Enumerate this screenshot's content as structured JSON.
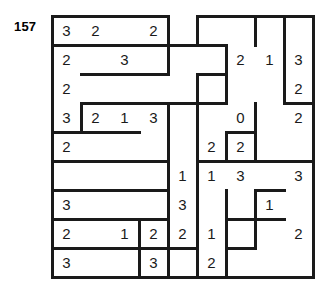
{
  "puzzle": {
    "label": "157",
    "grid": {
      "rows": 9,
      "cols": 9,
      "cell_size": 29,
      "origin_x": 52,
      "origin_y": 16
    },
    "line_color": "#1a1a1a",
    "digit_color": "#1a1a1a",
    "clues": [
      [
        {
          "c": 0,
          "v": "3"
        },
        {
          "c": 1,
          "v": "2"
        },
        {
          "c": 3,
          "v": "2"
        }
      ],
      [
        {
          "c": 0,
          "v": "2"
        },
        {
          "c": 2,
          "v": "3"
        },
        {
          "c": 6,
          "v": "2"
        },
        {
          "c": 7,
          "v": "1"
        },
        {
          "c": 8,
          "v": "3"
        }
      ],
      [
        {
          "c": 0,
          "v": "2"
        },
        {
          "c": 8,
          "v": "2"
        }
      ],
      [
        {
          "c": 0,
          "v": "3"
        },
        {
          "c": 1,
          "v": "2"
        },
        {
          "c": 2,
          "v": "1"
        },
        {
          "c": 3,
          "v": "3"
        },
        {
          "c": 6,
          "v": "0"
        },
        {
          "c": 8,
          "v": "2"
        }
      ],
      [
        {
          "c": 0,
          "v": "2"
        },
        {
          "c": 5,
          "v": "2"
        },
        {
          "c": 6,
          "v": "2"
        }
      ],
      [
        {
          "c": 4,
          "v": "1"
        },
        {
          "c": 5,
          "v": "1"
        },
        {
          "c": 6,
          "v": "3"
        },
        {
          "c": 8,
          "v": "3"
        }
      ],
      [
        {
          "c": 0,
          "v": "3"
        },
        {
          "c": 4,
          "v": "3"
        },
        {
          "c": 7,
          "v": "1"
        }
      ],
      [
        {
          "c": 0,
          "v": "2"
        },
        {
          "c": 2,
          "v": "1"
        },
        {
          "c": 3,
          "v": "2"
        },
        {
          "c": 4,
          "v": "2"
        },
        {
          "c": 5,
          "v": "1"
        },
        {
          "c": 8,
          "v": "2"
        }
      ],
      [
        {
          "c": 0,
          "v": "3"
        },
        {
          "c": 3,
          "v": "3"
        },
        {
          "c": 5,
          "v": "2"
        }
      ],
      [
        {
          "c": 0,
          "v": "1"
        },
        {
          "c": 1,
          "v": "2"
        },
        {
          "c": 4,
          "v": "2"
        },
        {
          "c": 6,
          "v": "2"
        },
        {
          "c": 8,
          "v": "2"
        }
      ]
    ],
    "walls_h": [
      {
        "r": 0,
        "c": 0
      },
      {
        "r": 0,
        "c": 1
      },
      {
        "r": 0,
        "c": 2
      },
      {
        "r": 0,
        "c": 3
      },
      {
        "r": 0,
        "c": 5
      },
      {
        "r": 0,
        "c": 6
      },
      {
        "r": 0,
        "c": 7
      },
      {
        "r": 0,
        "c": 8
      },
      {
        "r": 1,
        "c": 0
      },
      {
        "r": 1,
        "c": 1
      },
      {
        "r": 1,
        "c": 2
      },
      {
        "r": 1,
        "c": 3
      },
      {
        "r": 1,
        "c": 4
      },
      {
        "r": 1,
        "c": 5
      },
      {
        "r": 2,
        "c": 1
      },
      {
        "r": 2,
        "c": 2
      },
      {
        "r": 2,
        "c": 3
      },
      {
        "r": 2,
        "c": 5
      },
      {
        "r": 3,
        "c": 1
      },
      {
        "r": 3,
        "c": 2
      },
      {
        "r": 3,
        "c": 3
      },
      {
        "r": 3,
        "c": 4
      },
      {
        "r": 3,
        "c": 5
      },
      {
        "r": 3,
        "c": 8
      },
      {
        "r": 4,
        "c": 0
      },
      {
        "r": 4,
        "c": 1
      },
      {
        "r": 4,
        "c": 2
      },
      {
        "r": 4,
        "c": 6
      },
      {
        "r": 5,
        "c": 0
      },
      {
        "r": 5,
        "c": 1
      },
      {
        "r": 5,
        "c": 2
      },
      {
        "r": 5,
        "c": 3
      },
      {
        "r": 5,
        "c": 5
      },
      {
        "r": 5,
        "c": 6
      },
      {
        "r": 5,
        "c": 7
      },
      {
        "r": 5,
        "c": 8
      },
      {
        "r": 6,
        "c": 0
      },
      {
        "r": 6,
        "c": 1
      },
      {
        "r": 6,
        "c": 2
      },
      {
        "r": 6,
        "c": 3
      },
      {
        "r": 6,
        "c": 7
      },
      {
        "r": 7,
        "c": 0
      },
      {
        "r": 7,
        "c": 1
      },
      {
        "r": 7,
        "c": 2
      },
      {
        "r": 7,
        "c": 3
      },
      {
        "r": 7,
        "c": 6
      },
      {
        "r": 7,
        "c": 7
      },
      {
        "r": 8,
        "c": 0
      },
      {
        "r": 8,
        "c": 1
      },
      {
        "r": 8,
        "c": 2
      },
      {
        "r": 8,
        "c": 3
      },
      {
        "r": 8,
        "c": 4
      },
      {
        "r": 8,
        "c": 6
      },
      {
        "r": 9,
        "c": 0
      },
      {
        "r": 9,
        "c": 1
      },
      {
        "r": 9,
        "c": 2
      },
      {
        "r": 9,
        "c": 3
      },
      {
        "r": 9,
        "c": 4
      },
      {
        "r": 9,
        "c": 5
      },
      {
        "r": 9,
        "c": 6
      },
      {
        "r": 9,
        "c": 7
      },
      {
        "r": 9,
        "c": 8
      }
    ],
    "walls_v": [
      {
        "r": 0,
        "c": 0
      },
      {
        "r": 0,
        "c": 4
      },
      {
        "r": 0,
        "c": 5
      },
      {
        "r": 0,
        "c": 7
      },
      {
        "r": 0,
        "c": 8
      },
      {
        "r": 0,
        "c": 9
      },
      {
        "r": 1,
        "c": 0
      },
      {
        "r": 1,
        "c": 4
      },
      {
        "r": 1,
        "c": 6
      },
      {
        "r": 1,
        "c": 8
      },
      {
        "r": 1,
        "c": 9
      },
      {
        "r": 2,
        "c": 0
      },
      {
        "r": 2,
        "c": 5
      },
      {
        "r": 2,
        "c": 6
      },
      {
        "r": 2,
        "c": 8
      },
      {
        "r": 2,
        "c": 9
      },
      {
        "r": 3,
        "c": 0
      },
      {
        "r": 3,
        "c": 1
      },
      {
        "r": 3,
        "c": 4
      },
      {
        "r": 3,
        "c": 5
      },
      {
        "r": 3,
        "c": 7
      },
      {
        "r": 3,
        "c": 9
      },
      {
        "r": 4,
        "c": 0
      },
      {
        "r": 4,
        "c": 4
      },
      {
        "r": 4,
        "c": 5
      },
      {
        "r": 4,
        "c": 6
      },
      {
        "r": 4,
        "c": 7
      },
      {
        "r": 4,
        "c": 9
      },
      {
        "r": 5,
        "c": 0
      },
      {
        "r": 5,
        "c": 4
      },
      {
        "r": 5,
        "c": 5
      },
      {
        "r": 5,
        "c": 9
      },
      {
        "r": 6,
        "c": 0
      },
      {
        "r": 6,
        "c": 4
      },
      {
        "r": 6,
        "c": 5
      },
      {
        "r": 6,
        "c": 6
      },
      {
        "r": 6,
        "c": 7
      },
      {
        "r": 6,
        "c": 9
      },
      {
        "r": 7,
        "c": 0
      },
      {
        "r": 7,
        "c": 3
      },
      {
        "r": 7,
        "c": 4
      },
      {
        "r": 7,
        "c": 5
      },
      {
        "r": 7,
        "c": 6
      },
      {
        "r": 7,
        "c": 7
      },
      {
        "r": 7,
        "c": 9
      },
      {
        "r": 8,
        "c": 0
      },
      {
        "r": 8,
        "c": 3
      },
      {
        "r": 8,
        "c": 4
      },
      {
        "r": 8,
        "c": 5
      },
      {
        "r": 8,
        "c": 6
      },
      {
        "r": 8,
        "c": 9
      }
    ]
  }
}
